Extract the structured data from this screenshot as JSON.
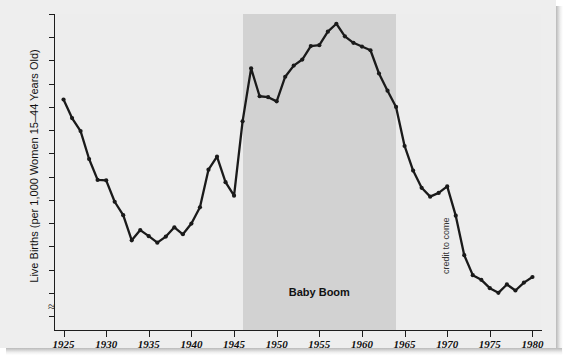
{
  "chart_data": {
    "type": "line",
    "title": "",
    "xlabel": "",
    "ylabel": "Live Births (per 1,000 Women 15–44 Years Old)",
    "xlim": [
      1924,
      1981
    ],
    "ylim": [
      57,
      125
    ],
    "y_axis_break": true,
    "y_axis_break_note": "axis broken below 60",
    "grid": false,
    "legend": "none",
    "series_name": "Live births per 1,000 women 15-44",
    "marker": "filled-circle",
    "line_color": "#1a1a1a",
    "ytick_labels": [
      "60",
      "65",
      "70",
      "75",
      "80",
      "85",
      "90",
      "95",
      "100",
      "105",
      "110",
      "115",
      "120",
      "125"
    ],
    "ytick_values": [
      60,
      65,
      70,
      75,
      80,
      85,
      90,
      95,
      100,
      105,
      110,
      115,
      120,
      125
    ],
    "xtick_labels": [
      "1925",
      "1930",
      "1935",
      "1940",
      "1945",
      "1950",
      "1955",
      "1960",
      "1965",
      "1970",
      "1975",
      "1980"
    ],
    "xtick_values": [
      1925,
      1930,
      1935,
      1940,
      1945,
      1950,
      1955,
      1960,
      1965,
      1970,
      1975,
      1980
    ],
    "x": [
      1925,
      1926,
      1927,
      1928,
      1929,
      1930,
      1931,
      1932,
      1933,
      1934,
      1935,
      1936,
      1937,
      1938,
      1939,
      1940,
      1941,
      1942,
      1943,
      1944,
      1945,
      1946,
      1947,
      1948,
      1949,
      1950,
      1951,
      1952,
      1953,
      1954,
      1955,
      1956,
      1957,
      1958,
      1959,
      1960,
      1961,
      1962,
      1963,
      1964,
      1965,
      1966,
      1967,
      1968,
      1969,
      1970,
      1971,
      1972,
      1973,
      1974,
      1975,
      1976,
      1977,
      1978,
      1979,
      1980
    ],
    "y": [
      106.6,
      102.6,
      99.8,
      93.8,
      89.3,
      89.2,
      84.6,
      81.7,
      76.3,
      78.5,
      77.2,
      75.8,
      77.1,
      79.1,
      77.6,
      79.9,
      83.4,
      91.5,
      94.3,
      88.8,
      85.9,
      101.9,
      113.3,
      107.3,
      107.1,
      106.2,
      111.5,
      113.9,
      115.2,
      118.1,
      118.3,
      121.2,
      122.9,
      120.2,
      118.8,
      118.0,
      117.2,
      112.2,
      108.5,
      105.0,
      96.6,
      91.3,
      87.6,
      85.7,
      86.5,
      87.9,
      81.6,
      73.1,
      68.8,
      67.8,
      66.0,
      65.0,
      66.8,
      65.5,
      67.2,
      68.4
    ],
    "annotations": [
      {
        "name": "baby-boom-band",
        "type": "shaded-span",
        "label": "Baby Boom",
        "x_start": 1946,
        "x_end": 1964,
        "color": "#d2d2d2",
        "label_x": 1955
      },
      {
        "name": "credit-placeholder",
        "type": "text",
        "label": "credit to come",
        "x": 1970,
        "rotation": -90
      }
    ]
  },
  "figure": {
    "background": "#eeeeee",
    "plot_background": "#ededed",
    "axis_color": "#1d1d1d",
    "axis_break_glyph": "≈"
  }
}
